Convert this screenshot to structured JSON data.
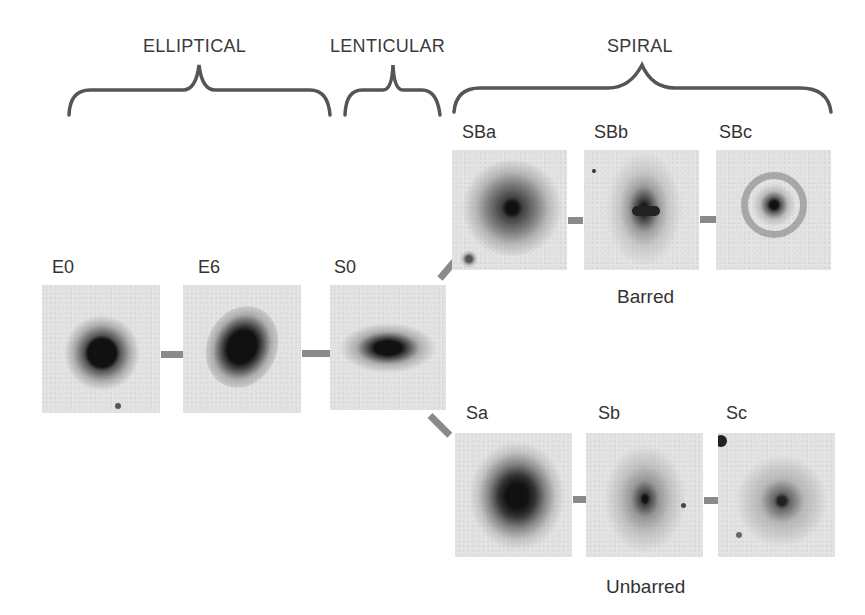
{
  "diagram": {
    "groups": [
      {
        "label": "ELLIPTICAL"
      },
      {
        "label": "LENTICULAR"
      },
      {
        "label": "SPIRAL"
      }
    ],
    "sequence": [
      {
        "label": "E0"
      },
      {
        "label": "E6"
      },
      {
        "label": "S0"
      }
    ],
    "barred": {
      "label": "Barred",
      "types": [
        {
          "label": "SBa"
        },
        {
          "label": "SBb"
        },
        {
          "label": "SBc"
        }
      ]
    },
    "unbarred": {
      "label": "Unbarred",
      "types": [
        {
          "label": "Sa"
        },
        {
          "label": "Sb"
        },
        {
          "label": "Sc"
        }
      ]
    },
    "colors": {
      "background": "#ffffff",
      "panel": "#e4e4e4",
      "connector": "#8a8a8a",
      "brace": "#555555",
      "text": "#333333"
    }
  }
}
